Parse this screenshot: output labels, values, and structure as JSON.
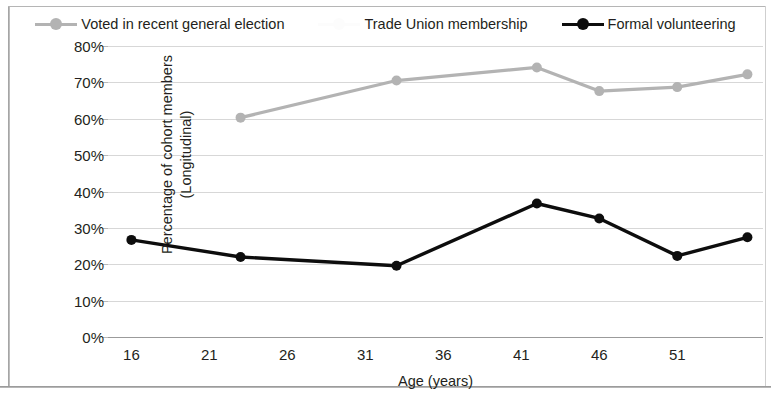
{
  "chart_data": {
    "type": "line",
    "title": "",
    "xlabel": "Age (years)",
    "ylabel": "Percentage of cohort members (Longitudinal)",
    "ylabel_lines": [
      "Percentage of cohort members",
      "(Longitudinal)"
    ],
    "xlim": [
      14.5,
      56.5
    ],
    "ylim": [
      0,
      80
    ],
    "ytick_labels": [
      "0%",
      "10%",
      "20%",
      "30%",
      "40%",
      "50%",
      "60%",
      "70%",
      "80%"
    ],
    "ytick_values": [
      0,
      10,
      20,
      30,
      40,
      50,
      60,
      70,
      80
    ],
    "xtick_labels": [
      "16",
      "21",
      "26",
      "31",
      "36",
      "41",
      "46",
      "51"
    ],
    "xtick_values": [
      16,
      21,
      26,
      31,
      36,
      41,
      46,
      51
    ],
    "grid": true,
    "legend_position": "top",
    "series": [
      {
        "name": "Voted in recent general election",
        "color": "#b3b3b3",
        "marker": "circle",
        "x": [
          23,
          33,
          42,
          46,
          51,
          55.5
        ],
        "values": [
          60.3,
          70.5,
          74.1,
          67.6,
          68.7,
          72.2
        ]
      },
      {
        "name": "Trade Union membership",
        "color": "#ffffff",
        "marker": "circle",
        "x": [],
        "values": []
      },
      {
        "name": "Formal volunteering",
        "color": "#0d0d0d",
        "marker": "circle",
        "x": [
          16,
          23,
          33,
          42,
          46,
          51,
          55.5
        ],
        "values": [
          26.7,
          22.0,
          19.6,
          36.7,
          32.6,
          22.3,
          27.4
        ]
      }
    ]
  },
  "legend": {
    "items": [
      {
        "label": "Voted in recent general election",
        "color": "#b3b3b3"
      },
      {
        "label": "Trade Union membership",
        "color": "#fcfcfc"
      },
      {
        "label": "Formal volunteering",
        "color": "#0d0d0d"
      }
    ]
  }
}
